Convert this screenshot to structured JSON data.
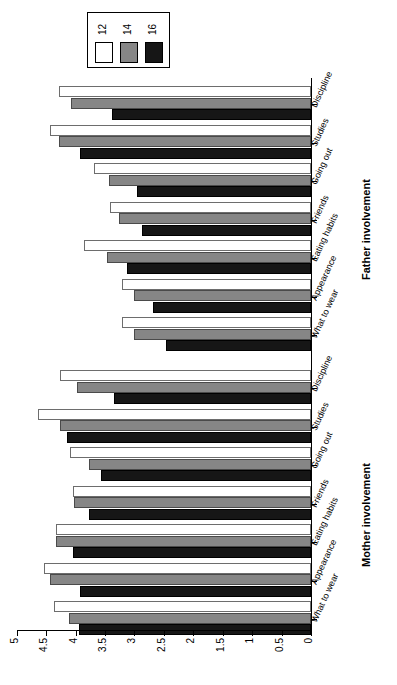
{
  "chart_data": {
    "type": "bar",
    "orientation": "horizontal",
    "title": "",
    "xlabel": "",
    "ylabel": "",
    "xlim": [
      0,
      5
    ],
    "grid": false,
    "legend_position": "top-left",
    "legend_title": "",
    "categories": [
      "What to wear",
      "Appearance",
      "Eating habits",
      "Friends",
      "Going out",
      "Studies",
      "Discipline"
    ],
    "groups": [
      "Father involvement",
      "Mother involvement"
    ],
    "series": [
      {
        "name": "12",
        "color": "#ffffff"
      },
      {
        "name": "14",
        "color": "#868686"
      },
      {
        "name": "16",
        "color": "#161616"
      }
    ],
    "tick_values": [
      "0",
      "0.5",
      "1",
      "1.5",
      "2",
      "2.5",
      "3",
      "3.5",
      "4",
      "4.5",
      "5"
    ],
    "data": {
      "Father involvement": {
        "What to wear": {
          "12": 3.22,
          "14": 3.0,
          "16": 2.47
        },
        "Appearance": {
          "12": 3.22,
          "14": 3.0,
          "16": 2.69
        },
        "Eating habits": {
          "12": 3.85,
          "14": 3.47,
          "16": 3.12
        },
        "Friends": {
          "12": 3.42,
          "14": 3.26,
          "16": 2.87
        },
        "Going out": {
          "12": 3.68,
          "14": 3.44,
          "16": 2.95
        },
        "Studies": {
          "12": 4.43,
          "14": 4.28,
          "16": 3.92
        },
        "Discipline": {
          "12": 4.28,
          "14": 4.08,
          "16": 3.38
        }
      },
      "Mother involvement": {
        "What to wear": {
          "12": 4.36,
          "14": 4.12,
          "16": 3.95
        },
        "Appearance": {
          "12": 4.53,
          "14": 4.43,
          "16": 3.92
        },
        "Eating habits": {
          "12": 4.33,
          "14": 4.34,
          "16": 4.05
        },
        "Friends": {
          "12": 4.05,
          "14": 4.02,
          "16": 3.77
        },
        "Going out": {
          "12": 4.1,
          "14": 3.78,
          "16": 3.56
        },
        "Studies": {
          "12": 4.64,
          "14": 4.27,
          "16": 4.15
        },
        "Discipline": {
          "12": 4.27,
          "14": 3.97,
          "16": 3.35
        }
      }
    }
  },
  "legend": {
    "entries": [
      {
        "label": "12",
        "color": "#ffffff"
      },
      {
        "label": "14",
        "color": "#868686"
      },
      {
        "label": "16",
        "color": "#161616"
      }
    ]
  },
  "axis": {
    "ticks": [
      "0",
      "0.5",
      "1",
      "1.5",
      "2",
      "2.5",
      "3",
      "3.5",
      "4",
      "4.5",
      "5"
    ]
  },
  "groups": {
    "father": "Father involvement",
    "mother": "Mother involvement"
  },
  "categories": [
    "What to wear",
    "Appearance",
    "Eating habits",
    "Friends",
    "Going out",
    "Studies",
    "Discipline"
  ]
}
